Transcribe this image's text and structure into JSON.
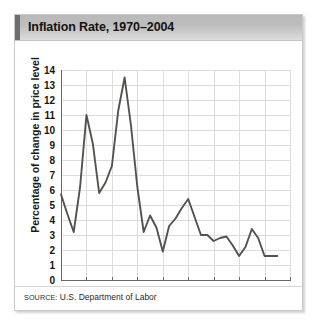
{
  "figure": {
    "title": "Inflation Rate, 1970–2004",
    "source_prefix": "SOURCE:",
    "source_body": " U.S. Department of Labor",
    "accent_color": "#6e6e6e",
    "line_color": "#54524f",
    "grid_color": "#dcdcdc"
  },
  "chart_data": {
    "type": "line",
    "title": "Inflation Rate, 1970–2004",
    "xlabel": "",
    "ylabel": "Percentage of change in price level",
    "xlim": [
      1970,
      2006
    ],
    "ylim": [
      0,
      14
    ],
    "grid": true,
    "legend": "none",
    "yticks": [
      0,
      1,
      2,
      3,
      4,
      5,
      6,
      7,
      8,
      9,
      10,
      11,
      12,
      13,
      14
    ],
    "xticks": [
      1970,
      1974,
      1978,
      1982,
      1986,
      1990,
      1994,
      1998,
      2002,
      2006
    ],
    "series": [
      {
        "name": "Inflation rate",
        "x": [
          1970,
          1971,
          1972,
          1973,
          1974,
          1975,
          1976,
          1977,
          1978,
          1979,
          1980,
          1981,
          1982,
          1983,
          1984,
          1985,
          1986,
          1987,
          1988,
          1989,
          1990,
          1991,
          1992,
          1993,
          1994,
          1995,
          1996,
          1997,
          1998,
          1999,
          2000,
          2001,
          2002,
          2003,
          2004
        ],
        "values": [
          5.7,
          4.4,
          3.2,
          6.2,
          11.0,
          9.1,
          5.8,
          6.5,
          7.6,
          11.3,
          13.5,
          10.3,
          6.2,
          3.2,
          4.3,
          3.5,
          1.9,
          3.6,
          4.1,
          4.8,
          5.4,
          4.2,
          3.0,
          3.0,
          2.6,
          2.8,
          2.9,
          2.3,
          1.6,
          2.2,
          3.4,
          2.8,
          1.6,
          1.6,
          1.6
        ]
      }
    ]
  }
}
